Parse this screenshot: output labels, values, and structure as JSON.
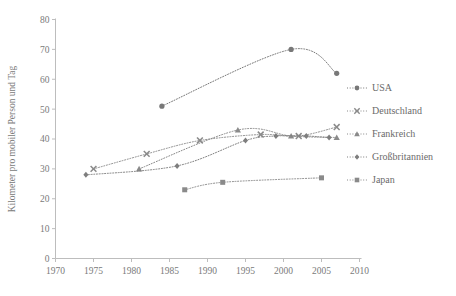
{
  "chart_data": {
    "type": "line",
    "title": "",
    "xlabel": "",
    "ylabel": "Kilometer pro mobiler Person und Tag",
    "xlim": [
      1970,
      2010
    ],
    "ylim": [
      0,
      80
    ],
    "xticks": [
      1970,
      1975,
      1980,
      1985,
      1990,
      1995,
      2000,
      2005,
      2010
    ],
    "yticks": [
      0,
      10,
      20,
      30,
      40,
      50,
      60,
      70,
      80
    ],
    "grid": false,
    "legend_position": "right",
    "line_style": "dotted",
    "color": "#8c8c8c",
    "series": [
      {
        "name": "USA",
        "marker": "circle",
        "color": "#787878",
        "points": [
          {
            "x": 1984,
            "y": 51
          },
          {
            "x": 2001,
            "y": 70
          },
          {
            "x": 2007,
            "y": 62
          }
        ]
      },
      {
        "name": "Deutschland",
        "marker": "cross",
        "color": "#8a8a8a",
        "points": [
          {
            "x": 1975,
            "y": 30
          },
          {
            "x": 1982,
            "y": 35
          },
          {
            "x": 1989,
            "y": 39.5
          },
          {
            "x": 1997,
            "y": 41.5
          },
          {
            "x": 2002,
            "y": 41
          },
          {
            "x": 2007,
            "y": 44
          }
        ]
      },
      {
        "name": "Frankreich",
        "marker": "triangle",
        "color": "#8a8a8a",
        "points": [
          {
            "x": 1981,
            "y": 30
          },
          {
            "x": 1994,
            "y": 43
          },
          {
            "x": 2001,
            "y": 41
          },
          {
            "x": 2007,
            "y": 40.5
          }
        ]
      },
      {
        "name": "Großbritannien",
        "marker": "diamond",
        "color": "#7e7e7e",
        "points": [
          {
            "x": 1974,
            "y": 28
          },
          {
            "x": 1986,
            "y": 31
          },
          {
            "x": 1995,
            "y": 39.5
          },
          {
            "x": 1999,
            "y": 41
          },
          {
            "x": 2003,
            "y": 41
          },
          {
            "x": 2006,
            "y": 40.5
          }
        ]
      },
      {
        "name": "Japan",
        "marker": "square",
        "color": "#8a8a8a",
        "points": [
          {
            "x": 1987,
            "y": 23
          },
          {
            "x": 1992,
            "y": 25.5
          },
          {
            "x": 2005,
            "y": 27
          }
        ]
      }
    ]
  },
  "legend": {
    "items": [
      {
        "label": "USA",
        "marker": "circle"
      },
      {
        "label": "Deutschland",
        "marker": "cross"
      },
      {
        "label": "Frankreich",
        "marker": "triangle"
      },
      {
        "label": "Großbritannien",
        "marker": "diamond"
      },
      {
        "label": "Japan",
        "marker": "square"
      }
    ]
  }
}
